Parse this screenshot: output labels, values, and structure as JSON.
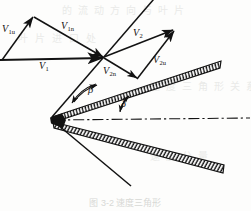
{
  "figure": {
    "background_color": "#fdfdfc",
    "line_color": "#121212"
  },
  "labels": {
    "v1u": "V",
    "v1u_sub": "1u",
    "v1n": "V",
    "v1n_sub": "1n",
    "v1": "V",
    "v1_sub": "1",
    "v2": "V",
    "v2_sub": "2",
    "v2u": "V",
    "v2u_sub": "2u",
    "v2n": "V",
    "v2n_sub": "2n",
    "beta": "β",
    "delta": "δ"
  },
  "annotations": {
    "caption": "图 3-2  速度三角形",
    "ghost_rows": [
      "的流动方向与叶片",
      "叶片进口处",
      "速度三角形关系",
      "速度分量"
    ]
  },
  "geometry": {
    "vector_junction": [
      103,
      57
    ],
    "blade_vertex": [
      52,
      117
    ],
    "centerline_style": "dash-dot",
    "angles": [
      "beta",
      "delta"
    ]
  }
}
